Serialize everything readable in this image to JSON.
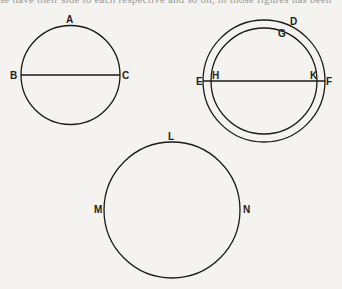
{
  "top_text": "se have their side to each respective and so on, in those figures has been",
  "diagram": {
    "stroke_color": "#1a1a1a",
    "figures": [
      {
        "id": "circle-abc",
        "labels": {
          "top": "A",
          "left": "B",
          "right": "C"
        },
        "center": [
          70.5,
          75
        ],
        "radius": 49.5,
        "chord": "BC"
      },
      {
        "id": "double-circle",
        "labels": {
          "outer_top": "D",
          "inner_top": "G",
          "outer_left": "E",
          "inner_left": "H",
          "inner_right": "K",
          "outer_right": "F"
        },
        "center": [
          264,
          81
        ],
        "outer_radius": 61,
        "inner_radius": 53,
        "chord": "EF"
      },
      {
        "id": "circle-lmn",
        "labels": {
          "top": "L",
          "left": "M",
          "right": "N"
        },
        "center": [
          172,
          210
        ],
        "radius": 68
      }
    ]
  }
}
